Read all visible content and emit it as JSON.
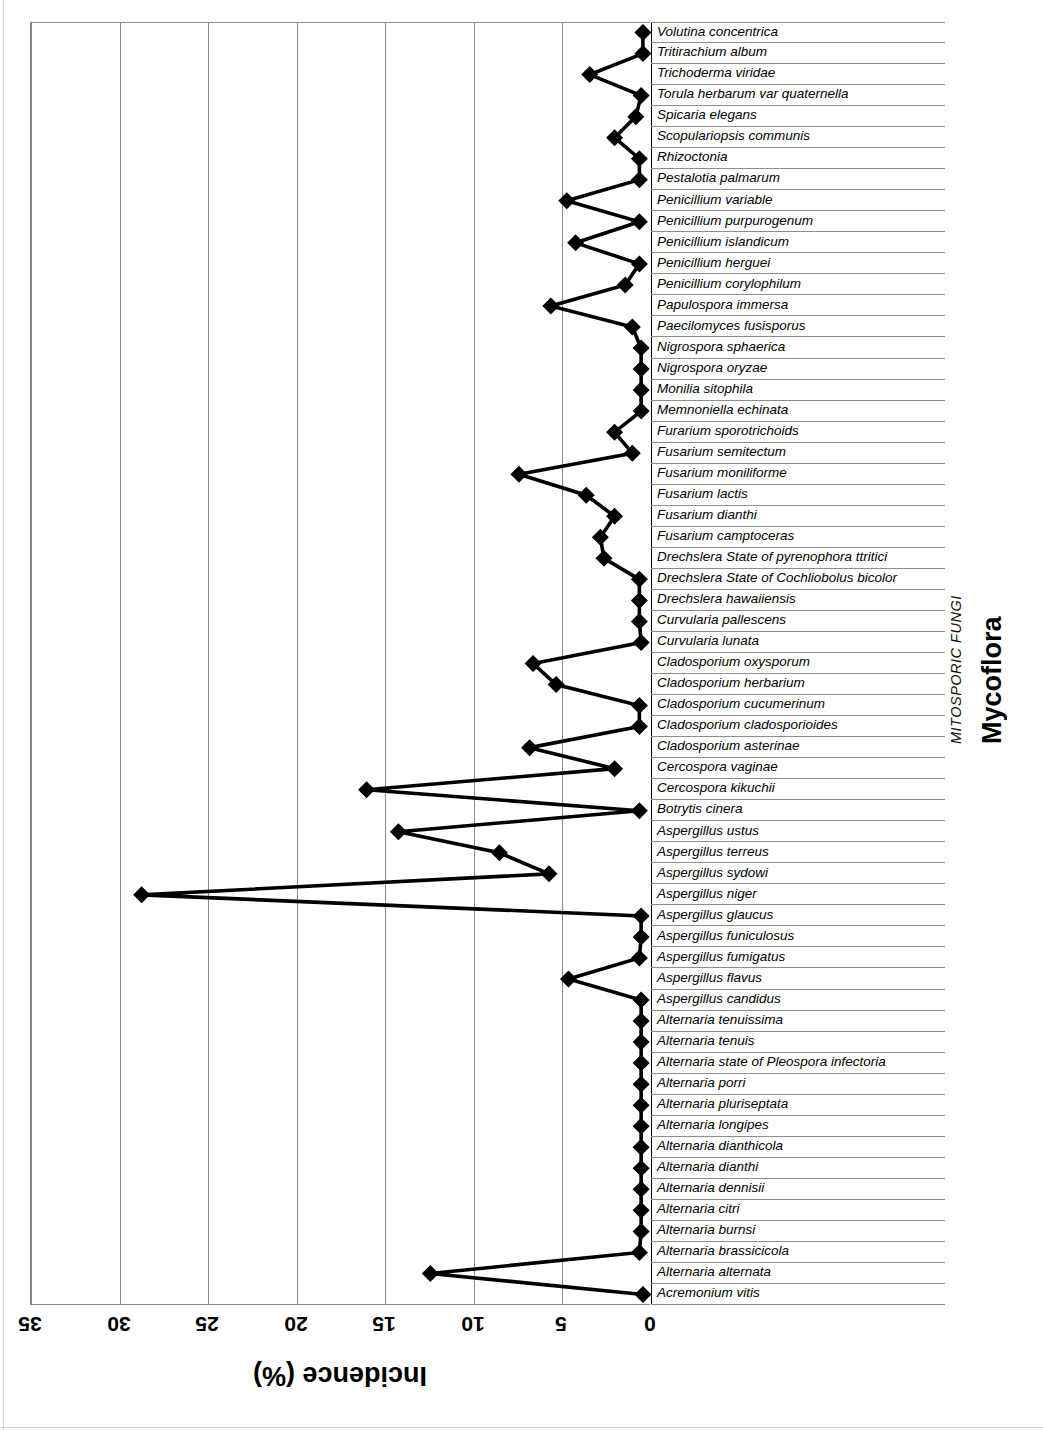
{
  "chart_title": "Mycoflora",
  "group_label": "MITOSPORIC FUNGI",
  "axis": {
    "x_title": "Incidence (%)",
    "x_ticks": [
      35,
      30,
      25,
      20,
      15,
      10,
      5,
      0
    ],
    "x_min": 0,
    "x_max": 35,
    "orientation": "horizontal-bars-rotated-180"
  },
  "chart_data": {
    "type": "line",
    "title": "Mycoflora",
    "subtitle": "MITOSPORIC FUNGI",
    "xlabel": "Incidence (%)",
    "ylabel": "",
    "xlim": [
      0,
      35
    ],
    "grid": true,
    "legend": "none",
    "orientation": "horizontal",
    "marker": "diamond",
    "categories": [
      "Volutina concentrica",
      "Tritirachium album",
      "Trichoderma viridae",
      "Torula herbarum var quaternella",
      "Spicaria elegans",
      "Scopulariopsis communis",
      "Rhizoctonia",
      "Pestalotia palmarum",
      "Penicillium variable",
      "Penicillium purpurogenum",
      "Penicillium islandicum",
      "Penicillium herguei",
      "Penicillium corylophilum",
      "Papulospora immersa",
      "Paecilomyces fusisporus",
      "Nigrospora sphaerica",
      "Nigrospora oryzae",
      "Monilia sitophila",
      "Memnoniella echinata",
      "Furarium sporotrichoids",
      "Fusarium semitectum",
      "Fusarium moniliforme",
      "Fusarium lactis",
      "Fusarium dianthi",
      "Fusarium camptoceras",
      "Drechslera State of pyrenophora ttritici",
      "Drechslera State of Cochliobolus bicolor",
      "Drechslera hawaiiensis",
      "Curvularia pallescens",
      "Curvularia lunata",
      "Cladosporium oxysporum",
      "Cladosporium herbarium",
      "Cladosporium cucumerinum",
      "Cladosporium cladosporioides",
      "Cladosporium asterinae",
      "Cercospora vaginae",
      "Cercospora kikuchii",
      "Botrytis cinera",
      "Aspergillus ustus",
      "Aspergillus terreus",
      "Aspergillus sydowi",
      "Aspergillus niger",
      "Aspergillus glaucus",
      "Aspergillus funiculosus",
      "Aspergillus fumigatus",
      "Aspergillus flavus",
      "Aspergillus candidus",
      "Alternaria tenuissima",
      "Alternaria tenuis",
      "Alternaria state of Pleospora infectoria",
      "Alternaria porri",
      "Alternaria pluriseptata",
      "Alternaria longipes",
      "Alternaria dianthicola",
      "Alternaria dianthi",
      "Alternaria dennisii",
      "Alternaria citri",
      "Alternaria burnsi",
      "Alternaria brassicicola",
      "Alternaria alternata",
      "Acremonium vitis"
    ],
    "values": [
      0.4,
      0.4,
      3.4,
      0.5,
      0.8,
      2.0,
      0.6,
      0.6,
      4.7,
      0.6,
      4.2,
      0.6,
      1.4,
      5.6,
      1.0,
      0.5,
      0.5,
      0.5,
      0.5,
      2.0,
      1.0,
      7.4,
      3.6,
      2.0,
      2.8,
      2.6,
      0.6,
      0.6,
      0.6,
      0.5,
      6.6,
      5.3,
      0.6,
      0.6,
      6.8,
      2.0,
      16.0,
      0.6,
      14.2,
      8.5,
      5.7,
      28.7,
      0.5,
      0.5,
      0.6,
      4.6,
      0.5,
      0.5,
      0.5,
      0.5,
      0.5,
      0.5,
      0.5,
      0.5,
      0.5,
      0.5,
      0.5,
      0.5,
      0.6,
      12.4,
      0.4
    ]
  }
}
